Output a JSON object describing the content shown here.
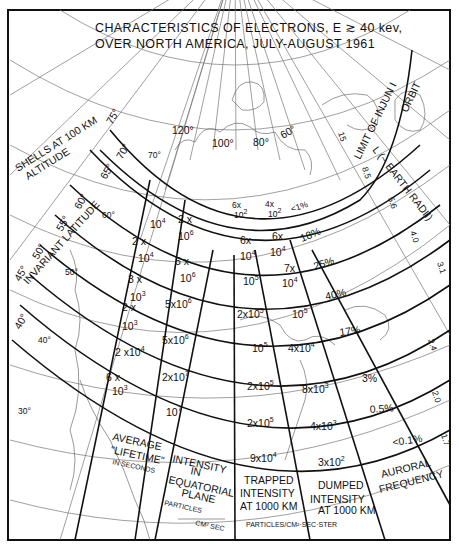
{
  "title": {
    "line1": "CHARACTERISTICS OF ELECTRONS, E ≳ 40 kev,",
    "line2": "OVER NORTH AMERICA, JULY-AUGUST 1961"
  },
  "annotations": {
    "shells": "SHELLS AT 100 KM",
    "altitude": "ALTITUDE",
    "invariant_latitude": "INVARIANT LATITUDE",
    "limit_orbit_1": "LIMIT OF INJUN I",
    "limit_orbit_2": "ORBIT",
    "l_label": "L (~ EARTH RADII)"
  },
  "invariant_latitudes": [
    "75°",
    "70°",
    "65°",
    "60°",
    "55°",
    "50°",
    "45°",
    "40°"
  ],
  "geographic_latitudes": [
    "70°",
    "60°",
    "50°",
    "40°",
    "30°"
  ],
  "longitudes": [
    "120°",
    "100°",
    "80°",
    "60°"
  ],
  "l_values": [
    "15",
    "8.5",
    "5.6",
    "4.0",
    "3.1",
    "2.4",
    "2.0",
    "1.7"
  ],
  "columns": {
    "lifetime": {
      "header": [
        "AVERAGE",
        "\"LIFETIME\"",
        "IN SECONDS"
      ],
      "values": [
        {
          "m": "",
          "e": "10",
          "x": "4"
        },
        {
          "m": "2 x",
          "e": "10",
          "x": "4"
        },
        {
          "m": "3 x",
          "e": "10",
          "x": "3"
        },
        {
          "m": "2 x",
          "e": "10",
          "x": "3"
        },
        {
          "m": "2 x",
          "e": "10",
          "x": "4"
        },
        {
          "m": "6 x",
          "e": "10",
          "x": "3"
        }
      ]
    },
    "equatorial": {
      "header": [
        "INTENSITY",
        "IN",
        "EQUATORIAL",
        "PLANE"
      ],
      "units": [
        "PARTICLES",
        "CM² SEC"
      ],
      "values": [
        {
          "m": "2 x",
          "e": "10",
          "x": "6"
        },
        {
          "m": "5 x",
          "e": "10",
          "x": "6"
        },
        {
          "m": "5x",
          "e": "10",
          "x": "6"
        },
        {
          "m": "5x",
          "e": "10",
          "x": "6"
        },
        {
          "m": "2x",
          "e": "10",
          "x": "7"
        },
        {
          "m": "",
          "e": "10",
          "x": "7"
        }
      ]
    },
    "trapped": {
      "header": [
        "TRAPPED",
        "INTENSITY",
        "AT 1000 KM"
      ],
      "values": [
        {
          "m": "6x",
          "e": "10",
          "x": "2"
        },
        {
          "m": "6x",
          "e": "10",
          "x": "4"
        },
        {
          "m": "",
          "e": "10",
          "x": "5"
        },
        {
          "m": "2x",
          "e": "10",
          "x": "5"
        },
        {
          "m": "",
          "e": "10",
          "x": "5"
        },
        {
          "m": "2x",
          "e": "10",
          "x": "5"
        },
        {
          "m": "2x",
          "e": "10",
          "x": "5"
        },
        {
          "m": "9x",
          "e": "10",
          "x": "4"
        }
      ]
    },
    "dumped": {
      "header": [
        "DUMPED",
        "INTENSITY",
        "AT 1000 KM"
      ],
      "values": [
        {
          "m": "4x",
          "e": "10",
          "x": "2"
        },
        {
          "m": "6x",
          "e": "10",
          "x": "4"
        },
        {
          "m": "7x",
          "e": "10",
          "x": "4"
        },
        {
          "m": "",
          "e": "10",
          "x": "5"
        },
        {
          "m": "4x",
          "e": "10",
          "x": "4"
        },
        {
          "m": "8x",
          "e": "10",
          "x": "3"
        },
        {
          "m": "4x",
          "e": "10",
          "x": "3"
        },
        {
          "m": "3x",
          "e": "10",
          "x": "2"
        }
      ]
    },
    "auroral": {
      "header": [
        "AURORAL",
        "FREQUENCY"
      ],
      "values": [
        "<1%",
        "18%",
        "25%",
        "40%",
        "17%",
        "3%",
        "0.5%",
        "<0.1%"
      ]
    }
  },
  "units_footer": "PARTICLES/CM²·SEC·STER"
}
